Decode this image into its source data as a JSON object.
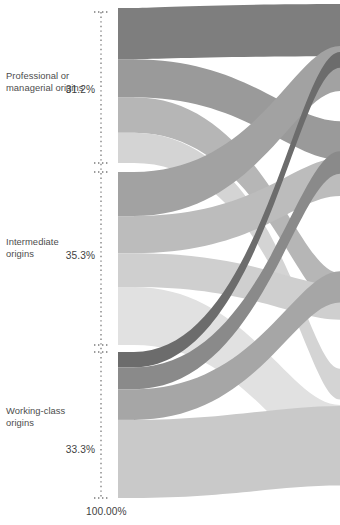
{
  "figure": {
    "type": "sankey",
    "title": "",
    "axis_total_label": "100.00%",
    "background_color": "#ffffff",
    "text_color": "#4d4d4d"
  },
  "axis": {
    "style": "dotted-vertical",
    "color": "#7a7a7a",
    "x": 101,
    "top": 12,
    "bottom": 498,
    "tick_positions": [
      12,
      163,
      172,
      345,
      352,
      498
    ]
  },
  "origins": [
    {
      "id": "professional",
      "label_line1": "Professional or",
      "label_line2": "managerial origins",
      "percent": "31.2%",
      "node_top": 8,
      "node_bottom": 163
    },
    {
      "id": "intermediate",
      "label_line1": "Intermediate",
      "label_line2": "origins",
      "percent": "35.3%",
      "node_top": 172,
      "node_bottom": 345
    },
    {
      "id": "working",
      "label_line1": "Working-class",
      "label_line2": "origins",
      "percent": "33.3%",
      "node_top": 352,
      "node_bottom": 498
    }
  ],
  "palette": {
    "dark": "#808080",
    "mid_dark": "#949494",
    "mid": "#a8a8a8",
    "mid_light": "#bdbdbd",
    "light": "#d0d0d0",
    "lighter": "#dcdcdc",
    "pale": "#e4e4e4",
    "darkest": "#6e6e6e"
  },
  "chart_data": {
    "type": "sankey",
    "title": "",
    "xlabel": "",
    "ylabel": "",
    "units": "percent",
    "total": "100.00%",
    "nodes": [
      {
        "name": "Professional or managerial origins",
        "value": 31.2,
        "side": "left"
      },
      {
        "name": "Intermediate origins",
        "value": 35.3,
        "side": "left"
      },
      {
        "name": "Working-class origins",
        "value": 33.3,
        "side": "left"
      }
    ],
    "links": [
      {
        "source": "Professional or managerial origins",
        "target": "Professional or managerial destinations",
        "value": 12.4,
        "color": "#808080"
      },
      {
        "source": "Professional or managerial origins",
        "target": "Intermediate destinations",
        "value": 8.6,
        "color": "#949494"
      },
      {
        "source": "Professional or managerial origins",
        "target": "Routine destinations",
        "value": 6.4,
        "color": "#bdbdbd"
      },
      {
        "source": "Professional or managerial origins",
        "target": "Working-class destinations",
        "value": 3.8,
        "color": "#d8d8d8"
      },
      {
        "source": "Intermediate origins",
        "target": "Professional or managerial destinations",
        "value": 10.6,
        "color": "#a8a8a8"
      },
      {
        "source": "Intermediate origins",
        "target": "Intermediate destinations",
        "value": 8.2,
        "color": "#c4c4c4"
      },
      {
        "source": "Intermediate origins",
        "target": "Routine destinations",
        "value": 7.1,
        "color": "#d0d0d0"
      },
      {
        "source": "Intermediate origins",
        "target": "Working-class destinations",
        "value": 9.4,
        "color": "#e2e2e2"
      },
      {
        "source": "Working-class origins",
        "target": "Professional or managerial destinations",
        "value": 3.1,
        "color": "#6e6e6e"
      },
      {
        "source": "Working-class origins",
        "target": "Intermediate destinations",
        "value": 5.2,
        "color": "#8c8c8c"
      },
      {
        "source": "Working-class origins",
        "target": "Routine destinations",
        "value": 8.0,
        "color": "#a4a4a4"
      },
      {
        "source": "Working-class origins",
        "target": "Working-class destinations",
        "value": 17.0,
        "color": "#c8c8c8"
      }
    ],
    "legend": [],
    "annotations": [
      "31.2%",
      "35.3%",
      "33.3%",
      "100.00%"
    ]
  }
}
